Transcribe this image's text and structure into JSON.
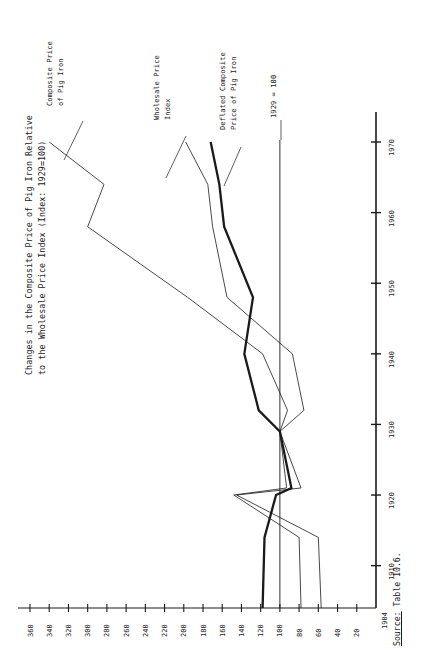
{
  "figure": {
    "title_line1": "Changes in the Composite Price of Pig Iron Relative",
    "title_line2": "to the Wholesale Price Index (Index: 1929=100)",
    "source_prefix": "Source:",
    "source_text": " Table 10.6.",
    "background_color": "#ffffff",
    "ink_color": "#1a1a1a"
  },
  "annotations": {
    "series1_l1": "Composite Price",
    "series1_l2": "of Pig Iron",
    "series2_l1": "Wholesale Price",
    "series2_l2": "Index",
    "series3_l1": "Deflated Composite",
    "series3_l2": "Price of Pig Iron",
    "baseline": "1929 = 100"
  },
  "axes": {
    "value_axis_label_start": "1904",
    "value_ticks": [
      "360",
      "340",
      "320",
      "300",
      "280",
      "260",
      "240",
      "220",
      "200",
      "180",
      "160",
      "140",
      "120",
      "100",
      "80",
      "60",
      "40",
      "20"
    ],
    "year_ticks": [
      "1910",
      "1920",
      "1930",
      "1940",
      "1950",
      "1960",
      "1970"
    ]
  },
  "chart_data": {
    "type": "line",
    "title": "Changes in the Composite Price of Pig Iron Relative to the Wholesale Price Index (Index: 1929=100)",
    "orientation": "rotated-90-ccw",
    "xlabel": "Year",
    "ylabel": "Index (1929 = 100)",
    "xlim": [
      1904,
      1972
    ],
    "ylim": [
      0,
      370
    ],
    "grid": false,
    "legend": "inline-annotations",
    "reference_line": {
      "value": 100,
      "label": "1929 = 100"
    },
    "series": [
      {
        "name": "Composite Price of Pig Iron",
        "style": "thin",
        "x": [
          1904,
          1914,
          1920,
          1921,
          1929,
          1932,
          1940,
          1948,
          1958,
          1964,
          1970
        ],
        "values": [
          57,
          60,
          145,
          78,
          100,
          92,
          118,
          196,
          300,
          283,
          340
        ]
      },
      {
        "name": "Wholesale Price Index",
        "style": "thin",
        "x": [
          1904,
          1914,
          1920,
          1921,
          1929,
          1932,
          1940,
          1948,
          1958,
          1964,
          1970
        ],
        "values": [
          78,
          80,
          148,
          93,
          100,
          75,
          87,
          155,
          170,
          175,
          198
        ]
      },
      {
        "name": "Deflated Composite Price of Pig Iron",
        "style": "thick",
        "x": [
          1904,
          1914,
          1920,
          1921,
          1929,
          1932,
          1940,
          1948,
          1958,
          1964,
          1970
        ],
        "values": [
          118,
          116,
          104,
          88,
          100,
          122,
          137,
          128,
          158,
          163,
          172
        ]
      }
    ]
  }
}
